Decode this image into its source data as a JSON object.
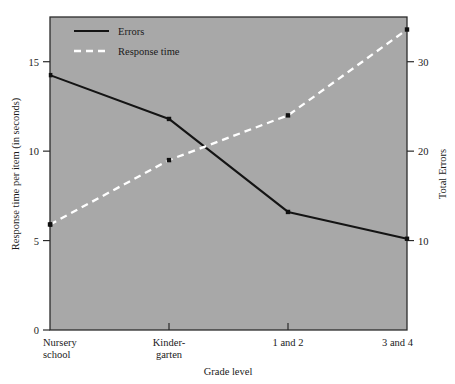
{
  "figure": {
    "background": "#ffffff",
    "plot_background": "#a8a8a8",
    "frame_color": "#2b2b2b"
  },
  "chart_data": {
    "type": "line",
    "title": "",
    "xlabel": "Grade level",
    "categories": [
      "Nursery school",
      "Kinder-garten",
      "1 and 2",
      "3 and 4"
    ],
    "category_lines": [
      [
        "Nursery",
        "school"
      ],
      [
        "Kinder-",
        "garten"
      ],
      [
        "1 and 2"
      ],
      [
        "3 and 4"
      ]
    ],
    "grid": false,
    "legend_position": "top-left",
    "axes": {
      "left": {
        "label": "Response time per item (in seconds)",
        "ticks": [
          0,
          5,
          10,
          15
        ],
        "tick_labels": [
          "0",
          "5",
          "10",
          "15"
        ],
        "range": [
          0,
          17.5
        ]
      },
      "right": {
        "label": "Total Errors",
        "ticks": [
          10,
          20,
          30
        ],
        "tick_labels": [
          "10",
          "20",
          "30"
        ],
        "range": [
          0,
          35
        ]
      }
    },
    "series": [
      {
        "name": "Errors",
        "axis": "right",
        "style": "solid",
        "color": "#141414",
        "values": [
          28.5,
          23.6,
          13.2,
          10.2
        ]
      },
      {
        "name": "Response time",
        "axis": "left",
        "style": "dashed",
        "color": "#ffffff",
        "values": [
          5.9,
          9.5,
          12.0,
          16.8
        ]
      }
    ]
  },
  "legend": {
    "items": [
      {
        "label": "Errors",
        "style": "solid",
        "color": "#141414"
      },
      {
        "label": "Response time",
        "style": "dashed",
        "color": "#ffffff"
      }
    ]
  }
}
